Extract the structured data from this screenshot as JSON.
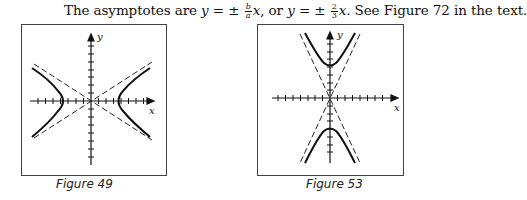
{
  "text_line": {
    "prefix": "The asymptotes are ",
    "eq1_lhs": "y",
    "eq1_op": " = ± ",
    "frac1_num": "b",
    "frac1_den": "a",
    "eq1_var": "x",
    "mid": ", or ",
    "eq2_lhs": "y",
    "eq2_op": " = ± ",
    "frac2_num": "2",
    "frac2_den": "3",
    "eq2_var": "x",
    "suffix": ".  See Figure 72 in the text."
  },
  "figures": [
    {
      "caption": "Figure 49",
      "x_label": "x",
      "y_label": "y",
      "type": "horizontal-hyperbola"
    },
    {
      "caption": "Figure 53",
      "x_label": "x",
      "y_label": "y",
      "type": "vertical-hyperbola"
    }
  ]
}
